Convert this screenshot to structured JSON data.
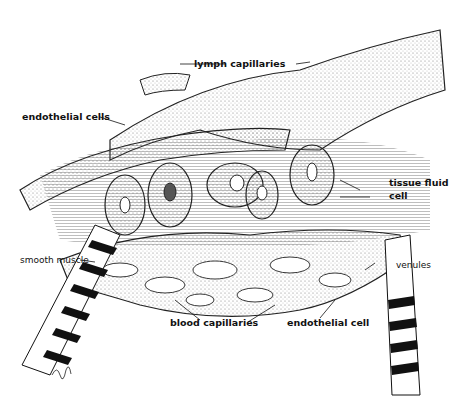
{
  "diagram": {
    "labels": {
      "lymph_capillaries": "lymph capillaries",
      "endothelial_cells": "endothelial cells",
      "tissue_fluid": "tissue fluid",
      "cell": "cell",
      "smooth_muscle": "smooth muscle",
      "venules": "venules",
      "blood_capillaries": "blood capillaries",
      "endothelial_cell": "endothelial cell"
    },
    "colors": {
      "ink": "#111111",
      "background": "#ffffff",
      "stipple": "#9a9a9a"
    }
  }
}
